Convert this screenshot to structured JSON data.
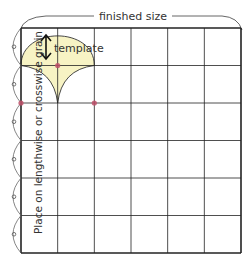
{
  "diagram": {
    "title_label": "finished size",
    "template_label": "template",
    "grain_label": "Place on lengthwise or crosswise grain",
    "grid": {
      "columns": 6,
      "rows": 6
    },
    "colors": {
      "grid_line": "#222222",
      "template_fill": "#f7f3c4",
      "template_stroke": "#333333",
      "marker_dot": "#c0506a",
      "bracket": "#444444"
    },
    "markers": [
      {
        "col": 1,
        "row": 1
      },
      {
        "col": 0,
        "row": 2
      },
      {
        "col": 2,
        "row": 2
      }
    ],
    "grain_arrow_icon": "double-headed-vertical-arrow",
    "scallop_marks": 6
  }
}
